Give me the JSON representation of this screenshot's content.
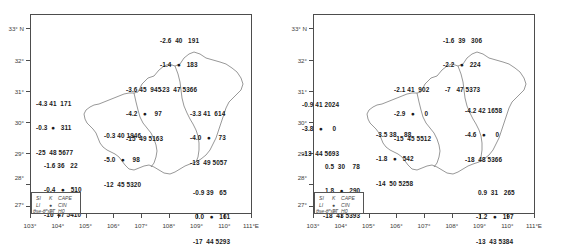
{
  "figure": {
    "type": "map",
    "panels": [
      {
        "id": "left-panel",
        "x_axis": {
          "ticks": [
            "103°",
            "104°",
            "105°",
            "106°",
            "107°",
            "108°",
            "109°",
            "110°",
            "111°E"
          ],
          "values": [
            103,
            104,
            105,
            106,
            107,
            108,
            109,
            110,
            111
          ]
        },
        "y_axis": {
          "ticks": [
            "33° N",
            "32°",
            "31°",
            "30°",
            "29°",
            "28°",
            "27°"
          ],
          "values": [
            33,
            32,
            31,
            30,
            29,
            28,
            27
          ]
        },
        "legend": {
          "row1": [
            "SI",
            "K",
            "CAPE"
          ],
          "row2": [
            "LI",
            "●",
            "CIN"
          ],
          "row3": [
            "θse-θ*se",
            "TT",
            "H0"
          ]
        },
        "stations": [
          {
            "name": "station-north",
            "x": 58.5,
            "y": 6.0,
            "line1": "-2.6  40   191",
            "line2": "-1.4   ●   183",
            "line3": "-23  47 5366"
          },
          {
            "name": "station-west",
            "x": 3.5,
            "y": 29.0,
            "line1": "-4.3 41  171",
            "line2": "-0.3  ●   311",
            "line3": "-25  48 5677"
          },
          {
            "name": "station-center-north",
            "x": 39.0,
            "y": 22.5,
            "line1": "-3.6 45  945",
            "line2": "-4.2   ●    97",
            "line3": "-15  49 5163"
          },
          {
            "name": "station-east-center",
            "x": 63.5,
            "y": 33.5,
            "line1": "-3.3 41  614",
            "line2": "-4.0   ●    73",
            "line3": "-13  49 5057"
          },
          {
            "name": "station-center",
            "x": 31.5,
            "y": 41.5,
            "line1": "-0.3 40 1946",
            "line2": "-5.0   ●    98",
            "line3": "-12  45 5320"
          },
          {
            "name": "station-southwest",
            "x": 6.5,
            "y": 53.5,
            "line1": "-1.6 36   22",
            "line2": "-0.4   ●   510",
            "line3": "-16  47 5410"
          },
          {
            "name": "station-southeast",
            "x": 65.5,
            "y": 68.5,
            "line1": "-0.9 39   65",
            "line2": " 0.0   ●   161",
            "line3": "-17  44 5293"
          }
        ]
      },
      {
        "id": "right-panel",
        "x_axis": {
          "ticks": [
            "103°",
            "104°",
            "105°",
            "106°",
            "107°",
            "108°",
            "109°",
            "110°",
            "111°E"
          ],
          "values": [
            103,
            104,
            105,
            106,
            107,
            108,
            109,
            110,
            111
          ]
        },
        "y_axis": {
          "ticks": [
            "33° N",
            "32°",
            "31°",
            "30°",
            "29°",
            "28°",
            "27°"
          ],
          "values": [
            33,
            32,
            31,
            30,
            29,
            28,
            27
          ]
        },
        "legend": {
          "row1": [
            "SI",
            "K",
            "CAPE"
          ],
          "row2": [
            "LI",
            "●",
            "CIN"
          ],
          "row3": [
            "θse-θ*se",
            "TT",
            "H0"
          ]
        },
        "stations": [
          {
            "name": "station-north",
            "x": 58.5,
            "y": 6.0,
            "line1": "-1.6  39   306",
            "line2": "-2.2   ●   224",
            "line3": " -7   47 5373"
          },
          {
            "name": "station-west",
            "x": 3.0,
            "y": 30.5,
            "line1": "-0.9 41 2024",
            "line2": "-3.8   ●     0",
            "line3": "-13  44 5693"
          },
          {
            "name": "station-center-north",
            "x": 39.0,
            "y": 22.5,
            "line1": "-2.1 41  902",
            "line2": "-2.9   ●     0",
            "line3": "-15  45 5512"
          },
          {
            "name": "station-east-center",
            "x": 63.5,
            "y": 33.5,
            "line1": "-4.2 42 1658",
            "line2": "-4.6   ●     0",
            "line3": "-18  48 5366"
          },
          {
            "name": "station-center",
            "x": 31.5,
            "y": 41.5,
            "line1": "-3.5 38    88",
            "line2": "-1.8   ●   542",
            "line3": "-14  50 5258"
          },
          {
            "name": "station-southwest",
            "x": 6.5,
            "y": 55.0,
            "line1": " 0.5  30    78",
            "line2": " 1.8   ●   290",
            "line3": "-18  43 5393"
          },
          {
            "name": "station-southeast",
            "x": 65.5,
            "y": 68.5,
            "line1": " 0.9  31   265",
            "line2": "-1.2   ●   197",
            "line3": "-13  43 5384"
          }
        ]
      }
    ],
    "colors": {
      "frame": "#4d4d4d",
      "text": "#1a1a1a",
      "axis_text": "#3c3c3c",
      "outline": "#6b6b6b"
    }
  }
}
